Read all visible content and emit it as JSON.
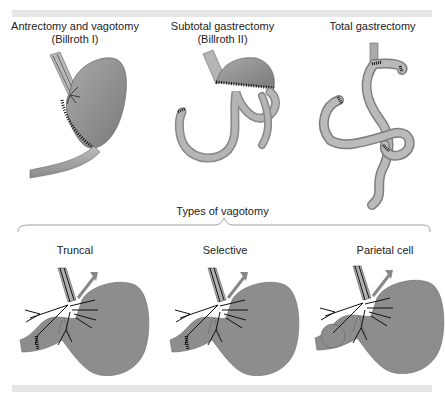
{
  "figure": {
    "top_row": {
      "panels": [
        {
          "title": "Antrectomy and vagotomy",
          "subtitle": "(Billroth I)"
        },
        {
          "title": "Subtotal gastrectomy",
          "subtitle": "(Billroth II)"
        },
        {
          "title": "Total gastrectomy",
          "subtitle": ""
        }
      ]
    },
    "bottom_row": {
      "group_title": "Types of vagotomy",
      "panels": [
        {
          "title": "Truncal"
        },
        {
          "title": "Selective"
        },
        {
          "title": "Parietal cell"
        }
      ]
    },
    "colors": {
      "organ_fill": "#8c8c8c",
      "organ_light": "#b3b3b3",
      "suture": "#1a1a1a",
      "nerve": "#111111",
      "band": "#e6e6e6"
    }
  }
}
